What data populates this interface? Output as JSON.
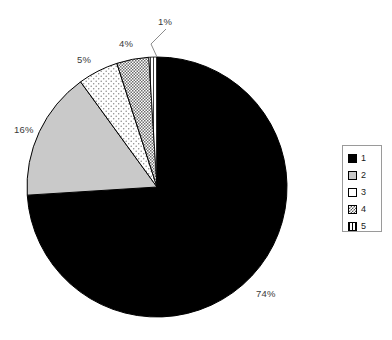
{
  "chart_data": {
    "type": "pie",
    "title": "",
    "categories": [
      "1",
      "2",
      "3",
      "4",
      "5"
    ],
    "values": [
      74,
      16,
      5,
      4,
      1
    ],
    "value_labels": [
      "74%",
      "16%",
      "5%",
      "4%",
      "1%"
    ],
    "legend_position": "right",
    "grid": false,
    "slice_styles": [
      {
        "name": "solid-black",
        "fill": "#000000"
      },
      {
        "name": "solid-gray",
        "fill": "#c9c9c9"
      },
      {
        "name": "sparse-dots",
        "fill": "#ffffff"
      },
      {
        "name": "crosshatch",
        "fill": "#ffffff"
      },
      {
        "name": "vertical-lines",
        "fill": "#ffffff"
      }
    ],
    "start_angle_deg": 90,
    "direction": "counterclockwise"
  },
  "pie": {
    "center_x": 157,
    "center_y": 187,
    "radius": 130,
    "labels": [
      {
        "id": "label-74",
        "text": "74%",
        "x": 256,
        "y": 289
      },
      {
        "id": "label-16",
        "text": "16%",
        "x": 14,
        "y": 125
      },
      {
        "id": "label-5",
        "text": "5%",
        "x": 77,
        "y": 55
      },
      {
        "id": "label-4",
        "text": "4%",
        "x": 119,
        "y": 39
      },
      {
        "id": "label-1",
        "text": "1%",
        "x": 158,
        "y": 17
      }
    ]
  },
  "legend": {
    "items": [
      {
        "label": "1",
        "swatch": "solid-black"
      },
      {
        "label": "2",
        "swatch": "solid-gray"
      },
      {
        "label": "3",
        "swatch": "solid-white"
      },
      {
        "label": "4",
        "swatch": "crosshatch"
      },
      {
        "label": "5",
        "swatch": "vertical-lines"
      }
    ]
  }
}
